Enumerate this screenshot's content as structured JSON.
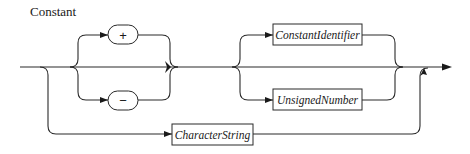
{
  "diagram": {
    "title": "Constant",
    "type": "syntax-diagram",
    "terminals": [
      {
        "id": "plus",
        "symbol": "+"
      },
      {
        "id": "minus",
        "symbol": "−"
      }
    ],
    "nonterminals": [
      {
        "id": "constant-identifier",
        "label": "ConstantIdentifier"
      },
      {
        "id": "unsigned-number",
        "label": "UnsignedNumber"
      },
      {
        "id": "character-string",
        "label": "CharacterString"
      }
    ],
    "paths": [
      [
        "optional sign (+ | − | none)",
        "ConstantIdentifier | UnsignedNumber"
      ],
      [
        "CharacterString"
      ]
    ]
  }
}
